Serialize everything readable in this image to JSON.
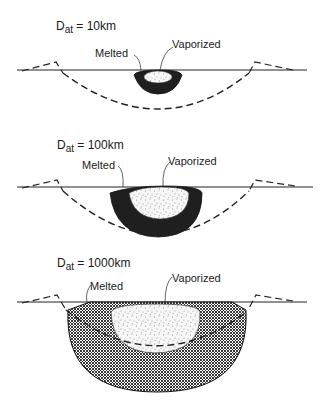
{
  "figure": {
    "panels": [
      {
        "title": {
          "symbol": "D",
          "subscript": "at",
          "equals": " = 10km"
        },
        "labels": {
          "melted": "Melted",
          "vaporized": "Vaporized"
        }
      },
      {
        "title": {
          "symbol": "D",
          "subscript": "at",
          "equals": " = 100km"
        },
        "labels": {
          "melted": "Melted",
          "vaporized": "Vaporized"
        }
      },
      {
        "title": {
          "symbol": "D",
          "subscript": "at",
          "equals": " = 1000km"
        },
        "labels": {
          "melted": "Melted",
          "vaporized": "Vaporized"
        }
      }
    ],
    "legend_meaning": {
      "crosshatch": "Melted",
      "stipple": "Vaporized",
      "dashed_line": "Transient crater outline / rim"
    }
  }
}
